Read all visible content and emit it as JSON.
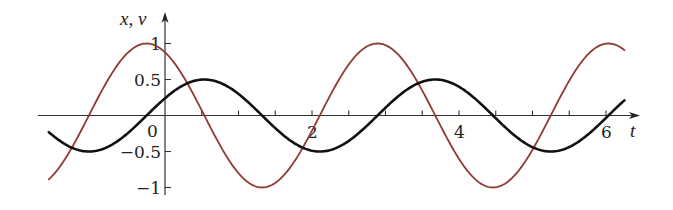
{
  "chart_data": {
    "type": "line",
    "title": "",
    "xlabel": "t",
    "ylabel": "x, v",
    "xlim": [
      -1.58,
      6.25
    ],
    "ylim": [
      -1,
      1
    ],
    "grid": false,
    "legend": null,
    "x_ticks": [
      0,
      2,
      4,
      6
    ],
    "x_tick_labels": [
      "0",
      "2",
      "4",
      "6"
    ],
    "x_minor_tick_step": 0.5,
    "y_ticks": [
      1,
      0.5,
      -0.5,
      -1
    ],
    "y_tick_labels": [
      "1",
      "0.5",
      "−0.5",
      "−1"
    ],
    "origin_label": "0",
    "series": [
      {
        "name": "x",
        "description": "displacement, x(t) = 0.5 sin(2t + 0.5)",
        "amplitude": 0.5,
        "omega": 2,
        "phase": 0.5,
        "func": "sin",
        "color": "#111111",
        "stroke_width": 2.6,
        "sample_points": [
          {
            "t": -1.5,
            "y": -0.45
          },
          {
            "t": -1.0,
            "y": -0.5
          },
          {
            "t": -0.25,
            "y": 0.0
          },
          {
            "t": 0.0,
            "y": 0.24
          },
          {
            "t": 0.54,
            "y": 0.5
          },
          {
            "t": 1.32,
            "y": 0.0
          },
          {
            "t": 2.11,
            "y": -0.5
          },
          {
            "t": 2.89,
            "y": 0.0
          },
          {
            "t": 3.68,
            "y": 0.5
          },
          {
            "t": 4.46,
            "y": 0.0
          },
          {
            "t": 5.25,
            "y": -0.5
          },
          {
            "t": 6.03,
            "y": 0.0
          },
          {
            "t": 6.25,
            "y": 0.21
          }
        ]
      },
      {
        "name": "v",
        "description": "velocity, v(t) = cos(2t + 0.5)",
        "amplitude": 1,
        "omega": 2,
        "phase": 0.5,
        "func": "cos",
        "color": "#8e3b32",
        "stroke_width": 1.8,
        "sample_points": [
          {
            "t": -1.5,
            "y": -0.9
          },
          {
            "t": -1.0,
            "y": 0.0
          },
          {
            "t": -0.25,
            "y": 1.0
          },
          {
            "t": 0.0,
            "y": 0.88
          },
          {
            "t": 0.54,
            "y": 0.0
          },
          {
            "t": 1.32,
            "y": -1.0
          },
          {
            "t": 2.11,
            "y": 0.0
          },
          {
            "t": 2.89,
            "y": 1.0
          },
          {
            "t": 3.68,
            "y": 0.0
          },
          {
            "t": 4.46,
            "y": -1.0
          },
          {
            "t": 5.25,
            "y": 0.0
          },
          {
            "t": 6.03,
            "y": 1.0
          },
          {
            "t": 6.25,
            "y": 0.9
          }
        ]
      }
    ]
  },
  "layout": {
    "origin_px": [
      165,
      115.5
    ],
    "px_per_t": 73.5,
    "px_per_y": 72,
    "x_axis_start_px": 38,
    "x_axis_end_px": 640,
    "y_axis_top_px": 12,
    "y_axis_bottom_px": 195
  }
}
